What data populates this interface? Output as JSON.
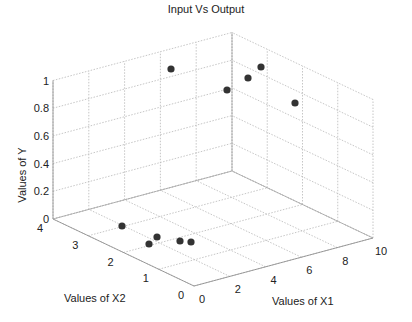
{
  "chart_data": {
    "type": "scatter3d",
    "title": "Input Vs Output",
    "xlabel": "Values of X1",
    "x2label": "Values of X2",
    "ylabel": "Values of Y",
    "x1_ticks": [
      "0",
      "2",
      "4",
      "6",
      "8",
      "10"
    ],
    "x2_ticks": [
      "0",
      "1",
      "2",
      "3",
      "4"
    ],
    "y_ticks": [
      "0",
      "0.2",
      "0.4",
      "0.6",
      "0.8",
      "1"
    ],
    "x1_range": [
      0,
      10
    ],
    "x2_range": [
      0,
      4
    ],
    "y_range": [
      0,
      1
    ],
    "grid": true,
    "marker": "filled-circle",
    "marker_color": "#333333",
    "points": [
      {
        "x1": 1.9,
        "x2": 3.0,
        "y": 0
      },
      {
        "x1": 2.4,
        "x2": 2.3,
        "y": 0
      },
      {
        "x1": 1.6,
        "x2": 2.1,
        "y": 0
      },
      {
        "x1": 2.9,
        "x2": 1.9,
        "y": 0
      },
      {
        "x1": 3.2,
        "x2": 1.7,
        "y": 0
      },
      {
        "x1": 3.0,
        "x2": 3.7,
        "y": 1
      },
      {
        "x1": 6.4,
        "x2": 3.7,
        "y": 1
      },
      {
        "x1": 7.4,
        "x2": 3.6,
        "y": 1
      },
      {
        "x1": 7.9,
        "x2": 3.8,
        "y": 1
      },
      {
        "x1": 8.2,
        "x2": 2.4,
        "y": 1
      }
    ]
  },
  "screen_points": [
    [
      122,
      226
    ],
    [
      157,
      237
    ],
    [
      149,
      244
    ],
    [
      180,
      241
    ],
    [
      191,
      242
    ],
    [
      171,
      69
    ],
    [
      227,
      90
    ],
    [
      248,
      78
    ],
    [
      261,
      67
    ],
    [
      295,
      103
    ]
  ]
}
